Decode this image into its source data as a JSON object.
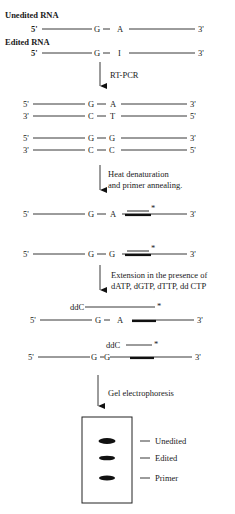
{
  "labels": {
    "unedited_rna": "Unedited RNA",
    "edited_rna": "Edited RNA",
    "five_prime": "5'",
    "three_prime": "3'",
    "step1": "RT-PCR",
    "step2_line1": "Heat denaturation",
    "step2_line2": "and primer annealing.",
    "step3_line1": "Extension in the presence of",
    "step3_line2": "dATP, dGTP, dTTP, dd CTP",
    "step4": "Gel electrophoresis",
    "ddc": "ddC",
    "asterisk": "*"
  },
  "rna": {
    "unedited": {
      "base1": "G",
      "base2": "A"
    },
    "edited": {
      "base1": "G",
      "base2": "I"
    }
  },
  "cdna": {
    "unedited": {
      "top": [
        "G",
        "A"
      ],
      "bottom": [
        "C",
        "T"
      ]
    },
    "edited": {
      "top": [
        "G",
        "G"
      ],
      "bottom": [
        "C",
        "C"
      ]
    }
  },
  "annealed": {
    "unedited": [
      "G",
      "A"
    ],
    "edited": [
      "G",
      "G"
    ]
  },
  "extended": {
    "unedited": [
      "G",
      "A"
    ],
    "edited": [
      "G",
      "G"
    ]
  },
  "gel": {
    "bands": [
      "Unedited",
      "Edited",
      "Primer"
    ]
  }
}
